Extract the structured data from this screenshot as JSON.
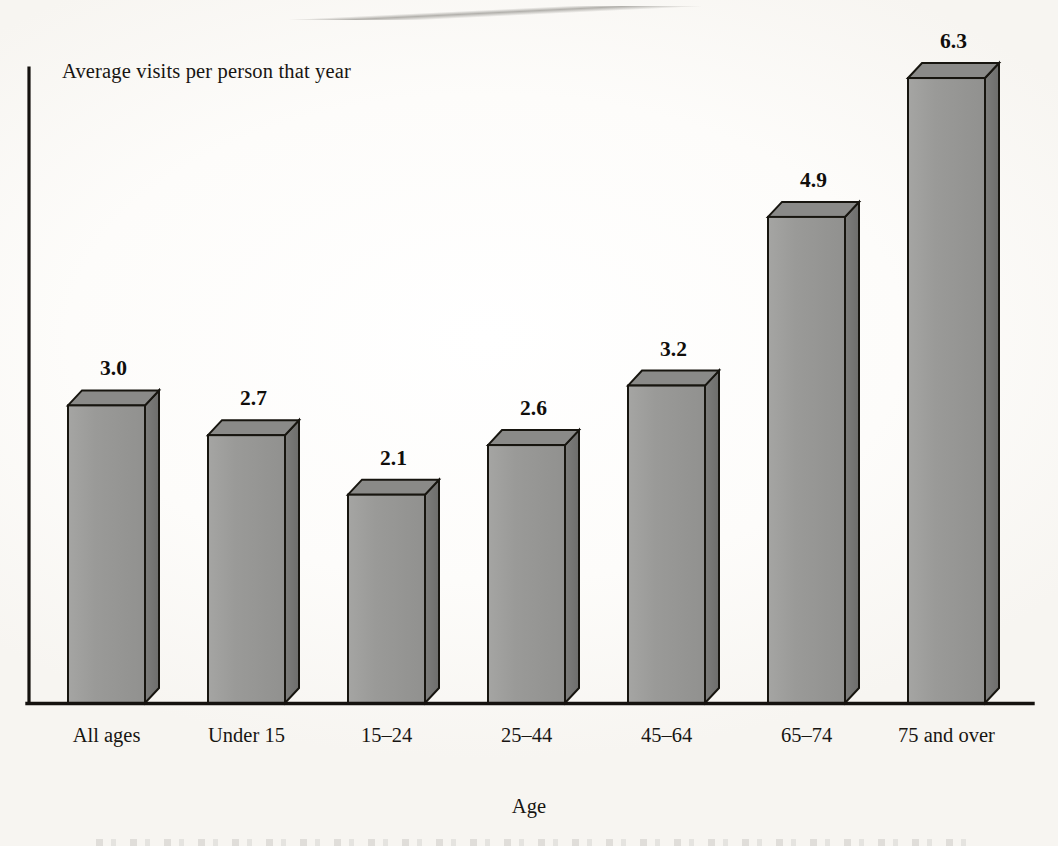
{
  "figure": {
    "axis_y_title": "Average visits per person that year",
    "axis_x_title": "Age",
    "bar_fill": "#9b9b99",
    "bar_top": "#8a8a88",
    "bar_side": "#767674",
    "axis_color": "#15120f",
    "background": "#fdfcfa"
  },
  "chart_data": {
    "type": "bar",
    "title": "",
    "subtitle": "",
    "xlabel": "Age",
    "ylabel": "Average visits per person that year",
    "categories": [
      "All ages",
      "Under 15",
      "15–24",
      "25–44",
      "45–64",
      "65–74",
      "75 and over"
    ],
    "values": [
      3.0,
      2.7,
      2.1,
      2.6,
      3.2,
      4.9,
      6.3
    ],
    "value_labels": [
      "3.0",
      "2.7",
      "2.1",
      "2.6",
      "3.2",
      "4.9",
      "6.3"
    ],
    "ylim": [
      0,
      6.9
    ],
    "grid": false,
    "legend": null,
    "tick_labels_y": [],
    "style": "3d-isometric-bars",
    "series": [
      {
        "name": "Average visits per person that year",
        "values": [
          3.0,
          2.7,
          2.1,
          2.6,
          3.2,
          4.9,
          6.3
        ]
      }
    ]
  }
}
